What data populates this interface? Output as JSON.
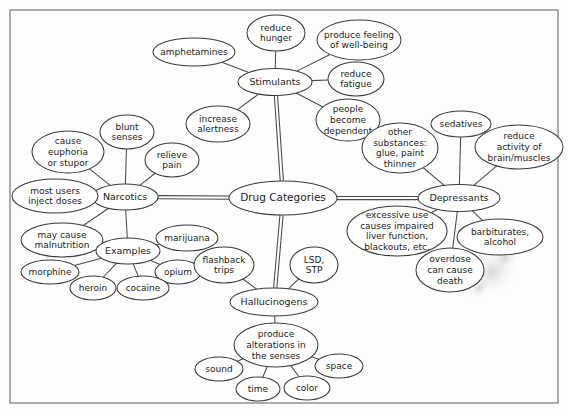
{
  "document": {
    "title": "Drug Categories Concept Map",
    "border_color": "#6b6b6b",
    "node_stroke": "#3a3a3a",
    "edge_color": "#4a4a4a",
    "background": "#fdfdfc"
  },
  "chart_data": {
    "type": "diagram",
    "subtype": "concept-map",
    "title": "Drug Categories",
    "root": "Drug Categories",
    "branch_count": 4,
    "node_count": 38,
    "edge_count": 37
  },
  "nodes": [
    {
      "id": "root",
      "label": "Drug Categories",
      "cx": 283,
      "cy": 198,
      "rx": 54,
      "ry": 17,
      "fs": 10.5,
      "lines": [
        "Drug Categories"
      ]
    },
    {
      "id": "stimulants",
      "label": "Stimulants",
      "cx": 275,
      "cy": 82,
      "rx": 37,
      "ry": 13.5,
      "fs": 9.5,
      "lines": [
        "Stimulants"
      ]
    },
    {
      "id": "reduce_hunger",
      "label": "reduce hunger",
      "cx": 276,
      "cy": 33,
      "rx": 29,
      "ry": 18,
      "fs": 9,
      "lines": [
        "reduce",
        "hunger"
      ]
    },
    {
      "id": "wellbeing",
      "label": "produce feeling of well-being",
      "cx": 359,
      "cy": 40,
      "rx": 42,
      "ry": 20,
      "fs": 9,
      "lines": [
        "produce feeling",
        "of well-being"
      ]
    },
    {
      "id": "reduce_fatigue",
      "label": "reduce fatigue",
      "cx": 356,
      "cy": 79,
      "rx": 28,
      "ry": 17,
      "fs": 9,
      "lines": [
        "reduce",
        "fatigue"
      ]
    },
    {
      "id": "amphetamines",
      "label": "amphetamines",
      "cx": 194,
      "cy": 52,
      "rx": 41,
      "ry": 14,
      "fs": 9,
      "lines": [
        "amphetamines"
      ]
    },
    {
      "id": "increase_alert",
      "label": "increase alertness",
      "cx": 218,
      "cy": 124,
      "rx": 32,
      "ry": 18,
      "fs": 9,
      "lines": [
        "increase",
        "alertness"
      ]
    },
    {
      "id": "dependent",
      "label": "people become dependent",
      "cx": 348,
      "cy": 120,
      "rx": 32,
      "ry": 21,
      "fs": 9,
      "lines": [
        "people",
        "become",
        "dependent"
      ]
    },
    {
      "id": "narcotics",
      "label": "Narcotics",
      "cx": 125,
      "cy": 197,
      "rx": 33,
      "ry": 13,
      "fs": 9.5,
      "lines": [
        "Narcotics"
      ]
    },
    {
      "id": "blunt_senses",
      "label": "blunt senses",
      "cx": 127,
      "cy": 132,
      "rx": 27,
      "ry": 17,
      "fs": 9,
      "lines": [
        "blunt",
        "senses"
      ]
    },
    {
      "id": "euphoria",
      "label": "cause euphoria or stupor",
      "cx": 68,
      "cy": 152,
      "rx": 36,
      "ry": 21,
      "fs": 9,
      "lines": [
        "cause",
        "euphoria",
        "or stupor"
      ]
    },
    {
      "id": "relieve_pain",
      "label": "relieve pain",
      "cx": 172,
      "cy": 160,
      "rx": 27,
      "ry": 17,
      "fs": 9,
      "lines": [
        "relieve",
        "pain"
      ]
    },
    {
      "id": "inject_doses",
      "label": "most users inject doses",
      "cx": 55,
      "cy": 196,
      "rx": 43,
      "ry": 17,
      "fs": 9,
      "lines": [
        "most users",
        "inject doses"
      ]
    },
    {
      "id": "malnutrition",
      "label": "may cause malnutrition",
      "cx": 62,
      "cy": 240,
      "rx": 41,
      "ry": 17,
      "fs": 9,
      "lines": [
        "may cause",
        "malnutrition"
      ]
    },
    {
      "id": "examples",
      "label": "Examples",
      "cx": 128,
      "cy": 251,
      "rx": 32,
      "ry": 13,
      "fs": 9.5,
      "lines": [
        "Examples"
      ]
    },
    {
      "id": "marijuana",
      "label": "marijuana",
      "cx": 187,
      "cy": 238,
      "rx": 31,
      "ry": 13,
      "fs": 9,
      "lines": [
        "marijuana"
      ]
    },
    {
      "id": "opium",
      "label": "opium",
      "cx": 178,
      "cy": 272,
      "rx": 23,
      "ry": 12,
      "fs": 9,
      "lines": [
        "opium"
      ]
    },
    {
      "id": "cocaine",
      "label": "cocaine",
      "cx": 143,
      "cy": 288,
      "rx": 26,
      "ry": 12,
      "fs": 9,
      "lines": [
        "cocaine"
      ]
    },
    {
      "id": "heroin",
      "label": "heroin",
      "cx": 93,
      "cy": 288,
      "rx": 23,
      "ry": 12,
      "fs": 9,
      "lines": [
        "heroin"
      ]
    },
    {
      "id": "morphine",
      "label": "morphine",
      "cx": 50,
      "cy": 272,
      "rx": 29,
      "ry": 12,
      "fs": 9,
      "lines": [
        "morphine"
      ]
    },
    {
      "id": "hallucinogens",
      "label": "Hallucinogens",
      "cx": 274,
      "cy": 302,
      "rx": 44,
      "ry": 14,
      "fs": 9.5,
      "lines": [
        "Hallucinogens"
      ]
    },
    {
      "id": "flashback",
      "label": "flashback trips",
      "cx": 224,
      "cy": 265,
      "rx": 30,
      "ry": 18,
      "fs": 9,
      "lines": [
        "flashback",
        "trips"
      ]
    },
    {
      "id": "lsd",
      "label": "LSD, STP",
      "cx": 314,
      "cy": 265,
      "rx": 24,
      "ry": 18,
      "fs": 9,
      "lines": [
        "LSD,",
        "STP"
      ]
    },
    {
      "id": "alterations",
      "label": "produce alterations in the senses",
      "cx": 276,
      "cy": 345,
      "rx": 42,
      "ry": 22,
      "fs": 9,
      "lines": [
        "produce",
        "alterations in",
        "the senses"
      ]
    },
    {
      "id": "sound",
      "label": "sound",
      "cx": 219,
      "cy": 369,
      "rx": 24,
      "ry": 12,
      "fs": 9,
      "lines": [
        "sound"
      ]
    },
    {
      "id": "space",
      "label": "space",
      "cx": 339,
      "cy": 366,
      "rx": 24,
      "ry": 12,
      "fs": 9,
      "lines": [
        "space"
      ]
    },
    {
      "id": "time",
      "label": "time",
      "cx": 258,
      "cy": 389,
      "rx": 22,
      "ry": 12,
      "fs": 9,
      "lines": [
        "time"
      ]
    },
    {
      "id": "color",
      "label": "color",
      "cx": 307,
      "cy": 388,
      "rx": 23,
      "ry": 12,
      "fs": 9,
      "lines": [
        "color"
      ]
    },
    {
      "id": "depressants",
      "label": "Depressants",
      "cx": 459,
      "cy": 198,
      "rx": 41,
      "ry": 13.5,
      "fs": 9.5,
      "lines": [
        "Depressants"
      ]
    },
    {
      "id": "sedatives",
      "label": "sedatives",
      "cx": 461,
      "cy": 124,
      "rx": 30,
      "ry": 13,
      "fs": 9,
      "lines": [
        "sedatives"
      ]
    },
    {
      "id": "reduce_activity",
      "label": "reduce activity of brain/muscles",
      "cx": 519,
      "cy": 147,
      "rx": 44,
      "ry": 22,
      "fs": 9,
      "lines": [
        "reduce",
        "activity of",
        "brain/muscles"
      ]
    },
    {
      "id": "other_subst",
      "label": "other substances: glue, paint thinner",
      "cx": 400,
      "cy": 148,
      "rx": 38,
      "ry": 25,
      "fs": 9,
      "lines": [
        "other",
        "substances:",
        "glue, paint",
        "thinner"
      ]
    },
    {
      "id": "excessive_use",
      "label": "excessive use causes impaired liver function, blackouts, etc.",
      "cx": 397,
      "cy": 231,
      "rx": 50,
      "ry": 25,
      "fs": 9,
      "lines": [
        "excessive use",
        "causes impaired",
        "liver function,",
        "blackouts, etc."
      ]
    },
    {
      "id": "barbiturates",
      "label": "barbiturates, alcohol",
      "cx": 500,
      "cy": 237,
      "rx": 43,
      "ry": 18,
      "fs": 9,
      "lines": [
        "barbiturates,",
        "alcohol"
      ]
    },
    {
      "id": "overdose",
      "label": "overdose can cause death",
      "cx": 450,
      "cy": 270,
      "rx": 34,
      "ry": 22,
      "fs": 9,
      "lines": [
        "overdose",
        "can cause",
        "death"
      ]
    }
  ],
  "edges": [
    {
      "from": "root",
      "to": "stimulants",
      "type": "trunk"
    },
    {
      "from": "root",
      "to": "narcotics",
      "type": "trunk"
    },
    {
      "from": "root",
      "to": "depressants",
      "type": "trunk"
    },
    {
      "from": "root",
      "to": "hallucinogens",
      "type": "trunk"
    },
    {
      "from": "stimulants",
      "to": "reduce_hunger",
      "type": "line"
    },
    {
      "from": "stimulants",
      "to": "wellbeing",
      "type": "line"
    },
    {
      "from": "stimulants",
      "to": "reduce_fatigue",
      "type": "line"
    },
    {
      "from": "stimulants",
      "to": "amphetamines",
      "type": "line"
    },
    {
      "from": "stimulants",
      "to": "increase_alert",
      "type": "line"
    },
    {
      "from": "stimulants",
      "to": "dependent",
      "type": "line"
    },
    {
      "from": "narcotics",
      "to": "blunt_senses",
      "type": "line"
    },
    {
      "from": "narcotics",
      "to": "euphoria",
      "type": "line"
    },
    {
      "from": "narcotics",
      "to": "relieve_pain",
      "type": "line"
    },
    {
      "from": "narcotics",
      "to": "inject_doses",
      "type": "line"
    },
    {
      "from": "narcotics",
      "to": "malnutrition",
      "type": "line"
    },
    {
      "from": "narcotics",
      "to": "examples",
      "type": "line"
    },
    {
      "from": "examples",
      "to": "marijuana",
      "type": "line"
    },
    {
      "from": "examples",
      "to": "opium",
      "type": "line"
    },
    {
      "from": "examples",
      "to": "cocaine",
      "type": "line"
    },
    {
      "from": "examples",
      "to": "heroin",
      "type": "line"
    },
    {
      "from": "examples",
      "to": "morphine",
      "type": "line"
    },
    {
      "from": "hallucinogens",
      "to": "flashback",
      "type": "line"
    },
    {
      "from": "hallucinogens",
      "to": "lsd",
      "type": "line"
    },
    {
      "from": "hallucinogens",
      "to": "alterations",
      "type": "line"
    },
    {
      "from": "alterations",
      "to": "sound",
      "type": "line"
    },
    {
      "from": "alterations",
      "to": "space",
      "type": "line"
    },
    {
      "from": "alterations",
      "to": "time",
      "type": "line"
    },
    {
      "from": "alterations",
      "to": "color",
      "type": "line"
    },
    {
      "from": "depressants",
      "to": "sedatives",
      "type": "line"
    },
    {
      "from": "depressants",
      "to": "reduce_activity",
      "type": "line"
    },
    {
      "from": "depressants",
      "to": "other_subst",
      "type": "line"
    },
    {
      "from": "depressants",
      "to": "excessive_use",
      "type": "line"
    },
    {
      "from": "depressants",
      "to": "barbiturates",
      "type": "line"
    },
    {
      "from": "depressants",
      "to": "overdose",
      "type": "line"
    }
  ],
  "frame": {
    "x": 10,
    "y": 10,
    "width": 548,
    "height": 393
  }
}
